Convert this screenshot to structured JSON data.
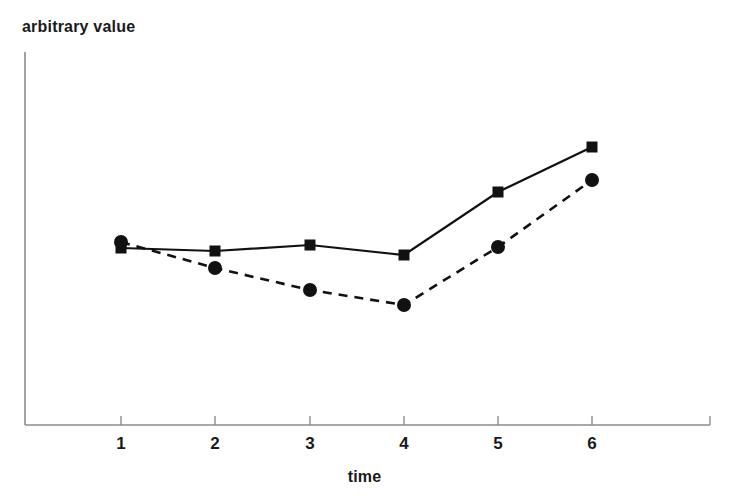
{
  "chart_data": {
    "type": "line",
    "title": "",
    "xlabel": "time",
    "ylabel": "arbitrary value",
    "categories": [
      "1",
      "2",
      "3",
      "4",
      "5",
      "6"
    ],
    "x": [
      1,
      2,
      3,
      4,
      5,
      6
    ],
    "xlim": [
      0.5,
      6.75
    ],
    "ylim": [
      0,
      10
    ],
    "grid": false,
    "legend": "none",
    "axis_color": "#888888",
    "series": [
      {
        "name": "solid-square-series",
        "marker": "square",
        "linestyle": "solid",
        "color": "#111111",
        "values": [
          4.8,
          4.72,
          4.88,
          4.62,
          6.25,
          7.45
        ],
        "pixel_y": [
          248,
          251,
          245,
          255,
          192,
          147
        ]
      },
      {
        "name": "dashed-circle-series",
        "marker": "circle",
        "linestyle": "dashed",
        "color": "#111111",
        "values": [
          4.95,
          4.25,
          3.68,
          3.28,
          4.95,
          6.58
        ],
        "pixel_y": [
          242,
          268,
          290,
          305,
          247,
          180
        ]
      }
    ],
    "pixel_x": [
      121,
      215,
      310,
      404,
      498,
      592
    ],
    "axes": {
      "y_axis_x": 25,
      "y_axis_top": 52,
      "x_axis_y": 425,
      "x_axis_right": 710,
      "end_tick": true
    }
  },
  "axis": {
    "tick_labels": [
      "1",
      "2",
      "3",
      "4",
      "5",
      "6"
    ]
  },
  "labels": {
    "y_axis_title": "arbitrary value",
    "x_axis_title": "time"
  }
}
